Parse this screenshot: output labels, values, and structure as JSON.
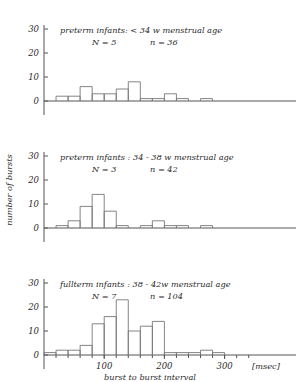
{
  "chart_data": {
    "type": "bar",
    "title": "",
    "xlabel": "burst to burst interval",
    "ylabel": "number of bursts",
    "xunit": "[msec]",
    "xlim": [
      0,
      350
    ],
    "ylim": [
      0,
      30
    ],
    "xticks": [
      100,
      200,
      300
    ],
    "yticks": [
      0,
      10,
      20,
      30
    ],
    "bin_width": 20,
    "grid": false,
    "panels": [
      {
        "title_line1": "preterm infants:  < 34 w  menstrual age",
        "title_line2_left": "N = 5",
        "title_line2_right": "n = 36",
        "N": 5,
        "n": 36,
        "bin_starts": [
          0,
          20,
          40,
          60,
          80,
          100,
          120,
          140,
          160,
          180,
          200,
          220,
          240,
          260,
          280,
          300,
          320
        ],
        "values": [
          0,
          2,
          2,
          6,
          3,
          3,
          5,
          8,
          1,
          1,
          3,
          1,
          0,
          1,
          0,
          0,
          0
        ]
      },
      {
        "title_line1": "preterm infants : 34 - 38 w  menstrual age",
        "title_line2_left": "N = 3",
        "title_line2_right": "n = 42",
        "N": 3,
        "n": 42,
        "bin_starts": [
          0,
          20,
          40,
          60,
          80,
          100,
          120,
          140,
          160,
          180,
          200,
          220,
          240,
          260,
          280,
          300,
          320
        ],
        "values": [
          0,
          1,
          3,
          9,
          14,
          7,
          1,
          0,
          1,
          3,
          1,
          1,
          0,
          1,
          0,
          0,
          0
        ]
      },
      {
        "title_line1": "fullterm infants : 38 - 42w  menstrual age",
        "title_line2_left": "N = 7",
        "title_line2_right": "n = 104",
        "N": 7,
        "n": 104,
        "bin_starts": [
          0,
          20,
          40,
          60,
          80,
          100,
          120,
          140,
          160,
          180,
          200,
          220,
          240,
          260,
          280,
          300,
          320
        ],
        "values": [
          1,
          2,
          2,
          4,
          13,
          16,
          23,
          10,
          12,
          14,
          1,
          1,
          1,
          2,
          1,
          0,
          0
        ]
      }
    ]
  }
}
